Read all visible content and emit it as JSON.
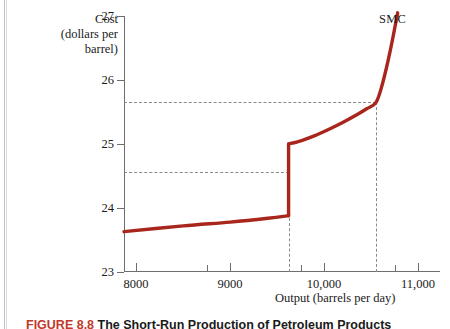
{
  "figure": {
    "smc_label": "SMC",
    "caption_number": "FIGURE 8.8",
    "caption_title": "The Short-Run Production of Petroleum Products",
    "curve_color": "#a8261c",
    "dash_color": "#8a8a8a",
    "axis_color": "#6e6e6e"
  },
  "y_axis": {
    "title_line1": "Cost",
    "title_line2": "(dollars per",
    "title_line3": "barrel)",
    "ticks": [
      "23",
      "24",
      "25",
      "26",
      "27"
    ],
    "min": 23,
    "max": 27
  },
  "x_axis": {
    "title": "Output (barrels per day)",
    "ticks": [
      "8000",
      "9000",
      "10,000",
      "11,000"
    ],
    "min": 7870,
    "max": 11230
  },
  "chart_data": {
    "type": "line",
    "title": "",
    "xlabel": "Output (barrels per day)",
    "ylabel": "Cost (dollars per barrel)",
    "xlim": [
      7870,
      11230
    ],
    "ylim": [
      23,
      27
    ],
    "xticks": [
      8000,
      9000,
      10000,
      11000
    ],
    "xticklabels": [
      "8000",
      "9000",
      "10,000",
      "11,000"
    ],
    "yticks": [
      23,
      24,
      25,
      26,
      27
    ],
    "yticklabels": [
      "23",
      "24",
      "25",
      "26",
      "27"
    ],
    "grid": false,
    "legend": "none",
    "series": [
      {
        "name": "SMC",
        "color": "#a8261c",
        "annotation": "SMC",
        "note": "short-run marginal cost with a jump discontinuity at ~9620 barrels per day",
        "segments": [
          {
            "name": "gently-rising-lower-branch",
            "points": [
              [
                7870,
                23.63
              ],
              [
                8500,
                23.72
              ],
              [
                9000,
                23.78
              ],
              [
                9400,
                23.84
              ],
              [
                9620,
                23.88
              ]
            ]
          },
          {
            "name": "vertical-jump",
            "points": [
              [
                9620,
                23.88
              ],
              [
                9620,
                25.0
              ]
            ]
          },
          {
            "name": "convex-rising-upper-branch",
            "points": [
              [
                9620,
                25.0
              ],
              [
                9750,
                25.05
              ],
              [
                9900,
                25.13
              ],
              [
                10050,
                25.23
              ],
              [
                10200,
                25.34
              ],
              [
                10350,
                25.46
              ],
              [
                10450,
                25.55
              ],
              [
                10550,
                25.65
              ],
              [
                10620,
                25.95
              ],
              [
                10700,
                26.45
              ],
              [
                10780,
                27.05
              ]
            ]
          }
        ]
      }
    ],
    "annotations": [
      {
        "type": "hline",
        "y": 25.65,
        "style": "dashed",
        "x_from": 7870,
        "x_to": 10550
      },
      {
        "type": "hline",
        "y": 24.57,
        "style": "dashed",
        "x_from": 7870,
        "x_to": 9620
      },
      {
        "type": "vline",
        "x": 9620,
        "style": "dashed",
        "y_from": 23.0,
        "y_to": 24.57
      },
      {
        "type": "vline",
        "x": 10550,
        "style": "dashed",
        "y_from": 23.0,
        "y_to": 25.65
      }
    ]
  }
}
